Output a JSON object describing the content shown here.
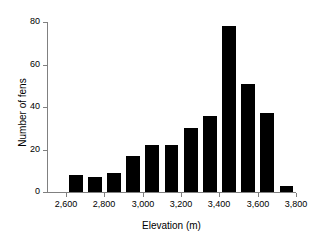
{
  "chart_data": {
    "type": "bar",
    "title": "",
    "xlabel": "Elevation (m)",
    "ylabel": "Number of fens",
    "categories": [
      "2,600",
      "2,700",
      "2,800",
      "2,900",
      "3,000",
      "3,100",
      "3,200",
      "3,300",
      "3,400",
      "3,500",
      "3,600",
      "3,700"
    ],
    "bin_starts": [
      2600,
      2700,
      2800,
      2900,
      3000,
      3100,
      3200,
      3300,
      3400,
      3500,
      3600,
      3700
    ],
    "bin_width": 100,
    "values": [
      8,
      7,
      9,
      17,
      22,
      22,
      30,
      36,
      78,
      51,
      37,
      3
    ],
    "xlim": [
      2500,
      3800
    ],
    "ylim": [
      0,
      80
    ],
    "x_ticks": [
      2600,
      2800,
      3000,
      3200,
      3400,
      3600,
      3800
    ],
    "x_tick_labels": [
      "2,600",
      "2,800",
      "3,000",
      "3,200",
      "3,400",
      "3,600",
      "3,800"
    ],
    "y_ticks": [
      0,
      20,
      40,
      60,
      80
    ],
    "y_tick_labels": [
      "0",
      "20",
      "40",
      "60",
      "80"
    ],
    "grid": false,
    "legend": null,
    "bar_color": "#000000",
    "axis_color": "#808080",
    "background_color": "#ffffff"
  }
}
